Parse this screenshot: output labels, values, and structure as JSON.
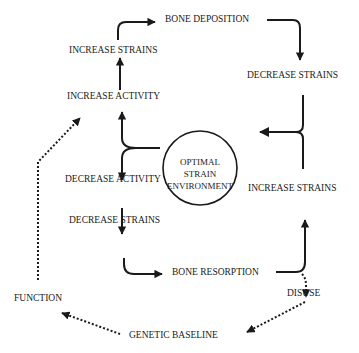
{
  "diagram": {
    "center": {
      "lines": [
        "OPTIMAL",
        "STRAIN",
        "ENVIRONMENT"
      ]
    },
    "nodes": {
      "bone_deposition": "BONE DEPOSITION",
      "increase_strains_top": "INCREASE STRAINS",
      "increase_activity": "INCREASE ACTIVITY",
      "decrease_strains_right": "DECREASE STRAINS",
      "decrease_activity": "DECREASE ACTIVITY",
      "decrease_strains_left": "DECREASE STRAINS",
      "bone_resorption": "BONE RESORPTION",
      "increase_strains_right": "INCREASE STRAINS",
      "disuse": "DISUSE",
      "function": "FUNCTION",
      "genetic_baseline": "GENETIC BASELINE"
    },
    "edges": [
      {
        "from": "OPTIMAL STRAIN ENVIRONMENT",
        "to": "INCREASE ACTIVITY",
        "style": "solid"
      },
      {
        "from": "OPTIMAL STRAIN ENVIRONMENT",
        "to": "DECREASE ACTIVITY",
        "style": "solid"
      },
      {
        "from": "INCREASE ACTIVITY",
        "to": "INCREASE STRAINS",
        "style": "solid"
      },
      {
        "from": "INCREASE STRAINS",
        "to": "BONE DEPOSITION",
        "style": "solid"
      },
      {
        "from": "BONE DEPOSITION",
        "to": "DECREASE STRAINS",
        "style": "solid"
      },
      {
        "from": "DECREASE STRAINS",
        "to": "OPTIMAL STRAIN ENVIRONMENT",
        "style": "solid"
      },
      {
        "from": "DECREASE ACTIVITY",
        "to": "DECREASE STRAINS",
        "style": "solid"
      },
      {
        "from": "DECREASE STRAINS",
        "to": "BONE RESORPTION",
        "style": "solid"
      },
      {
        "from": "BONE RESORPTION",
        "to": "INCREASE STRAINS",
        "style": "solid"
      },
      {
        "from": "INCREASE STRAINS",
        "to": "OPTIMAL STRAIN ENVIRONMENT",
        "style": "solid"
      },
      {
        "from": "BONE RESORPTION",
        "to": "DISUSE",
        "style": "dotted"
      },
      {
        "from": "DISUSE",
        "to": "GENETIC BASELINE",
        "style": "dotted"
      },
      {
        "from": "GENETIC BASELINE",
        "to": "FUNCTION",
        "style": "dotted"
      },
      {
        "from": "FUNCTION",
        "to": "INCREASE ACTIVITY",
        "style": "dotted"
      }
    ]
  }
}
